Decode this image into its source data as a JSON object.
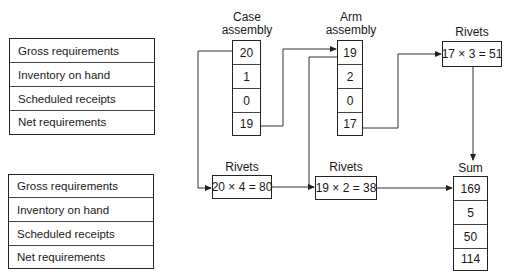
{
  "row_labels_top": [
    "Gross requirements",
    "Inventory on hand",
    "Scheduled receipts",
    "Net requirements"
  ],
  "row_labels_bottom": [
    "Gross requirements",
    "Inventory on hand",
    "Scheduled receipts",
    "Net requirements"
  ],
  "case_assembly": {
    "title_line1": "Case",
    "title_line2": "assembly",
    "values": [
      "20",
      "1",
      "0",
      "19"
    ]
  },
  "arm_assembly": {
    "title_line1": "Arm",
    "title_line2": "assembly",
    "values": [
      "19",
      "2",
      "0",
      "17"
    ]
  },
  "rivets_arm": {
    "title": "Rivets",
    "calc": "17 × 3 = 51"
  },
  "rivets_case": {
    "title": "Rivets",
    "calc": "20 × 4 = 80"
  },
  "rivets_case_net": {
    "title": "Rivets",
    "calc": "19 × 2 = 38"
  },
  "sum": {
    "title": "Sum",
    "values": [
      "169",
      "5",
      "50",
      "114"
    ]
  }
}
